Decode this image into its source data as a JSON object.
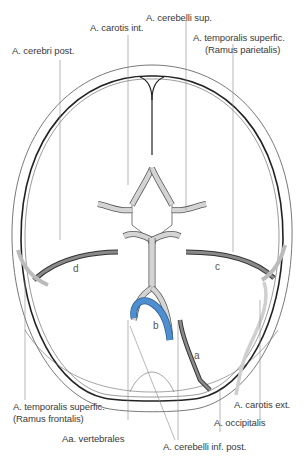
{
  "diagram": {
    "colors": {
      "artery": "#d4d4d4",
      "artery_dark": "#8a8a8a",
      "highlight_vessel": "#4f8fcf",
      "outline": "#222222",
      "leader": "#888888"
    },
    "labels": {
      "carotis_int": "A. carotis int.",
      "cerebelli_sup": "A. cerebelli sup.",
      "cerebri_post": "A. cerebri post.",
      "temporalis_parietalis_1": "A. temporalis superfic.",
      "temporalis_parietalis_2": "(Ramus parietalis)",
      "temporalis_frontalis_1": "A. temporalis superfic.",
      "temporalis_frontalis_2": "(Ramus frontalis)",
      "vertebrales": "Aa. vertebrales",
      "carotis_ext": "A. carotis ext.",
      "occipitalis": "A. occipitalis",
      "cerebelli_inf_post": "A. cerebelli inf. post."
    },
    "letters": {
      "a": "a",
      "b": "b",
      "c": "c",
      "d": "d"
    }
  }
}
